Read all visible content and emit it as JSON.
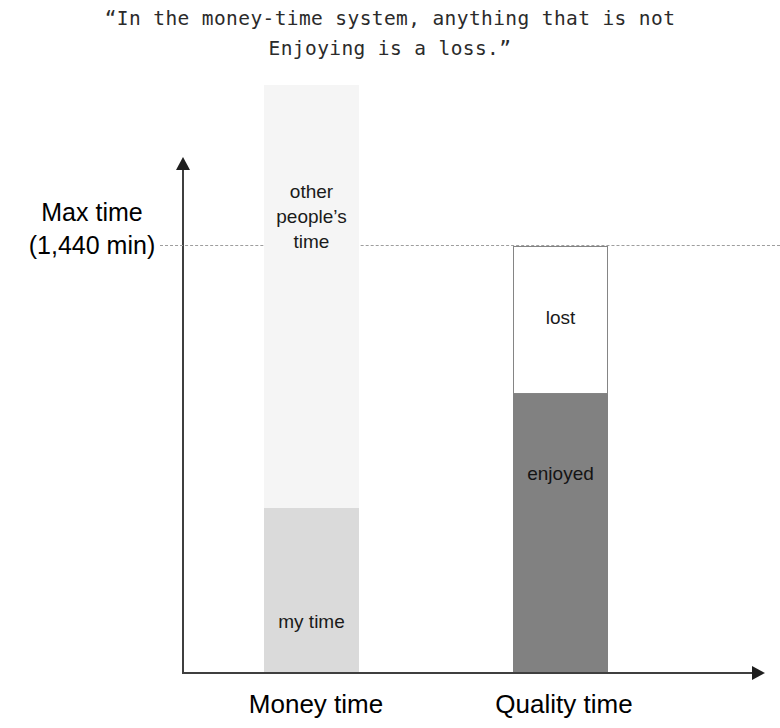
{
  "quote": "“In the money-time system, anything that is not\nEnjoying is a loss.”",
  "axis": {
    "y_annotation_line1": "Max time",
    "y_annotation_line2": "(1,440 min)"
  },
  "labels": {
    "money_other": "other\npeople’s\ntime",
    "money_mine": "my time",
    "quality_lost": "lost",
    "quality_enjoyed": "enjoyed",
    "category_money": "Money time",
    "category_quality": "Quality time"
  },
  "colors": {
    "other_peoples_time": "#f5f5f5",
    "my_time": "#dadada",
    "lost_fill": "#ffffff",
    "lost_border": "#858585",
    "enjoyed": "#818181",
    "axis": "#3f3f3f",
    "max_line": "#9e9e9e",
    "text": "#000000"
  },
  "chart_data": {
    "type": "bar",
    "title": "“In the money-time system, anything that is not Enjoying is a loss.”",
    "xlabel": "",
    "ylabel": "Max time (1,440 min)",
    "stacked": true,
    "grid": false,
    "legend": false,
    "annotations": [
      {
        "text": "Max time (1,440 min)",
        "type": "reference-line",
        "value": 1440,
        "style": "dashed",
        "orientation": "horizontal"
      }
    ],
    "yticks": [
      {
        "label": "Max time (1,440 min)",
        "value": 1440
      }
    ],
    "ylim": [
      0,
      1600
    ],
    "units": "minutes",
    "categories": [
      "Money time",
      "Quality time"
    ],
    "series": [
      {
        "name": "my time",
        "values": [
          320,
          null
        ],
        "note": "bottom segment of Money time bar; light grey",
        "color": "#dadada"
      },
      {
        "name": "other people’s time",
        "values": [
          1255,
          null
        ],
        "note": "upper segment of Money time bar, extends above the Max time line; near-white",
        "color": "#f5f5f5"
      },
      {
        "name": "enjoyed",
        "values": [
          null,
          810
        ],
        "note": "bottom segment of Quality time bar; dark grey",
        "color": "#818181"
      },
      {
        "name": "lost",
        "values": [
          null,
          630
        ],
        "note": "upper segment of Quality time bar, tops out exactly at the Max time line; unfilled/white",
        "color": "#ffffff"
      }
    ],
    "totals": [
      1575,
      1440
    ],
    "reading": "The Money time bar overflows past the Max time line because it includes other people's time; the Quality time bar is capped at the Max time line and is split into enjoyed and lost."
  }
}
